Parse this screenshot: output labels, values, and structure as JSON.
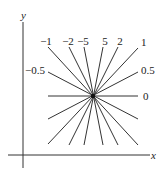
{
  "diagram": {
    "title": "",
    "axes": {
      "x_label": "x",
      "y_label": "y"
    },
    "center": {
      "x": 93,
      "y": 96
    },
    "lines": [
      {
        "slope_label": "0",
        "x1": 48,
        "y1": 96,
        "x2": 138,
        "y2": 96,
        "label_x": 143,
        "label_y": 100,
        "anchor": "start"
      },
      {
        "slope_label": "0.5",
        "x1": 48,
        "y1": 119,
        "x2": 138,
        "y2": 72,
        "label_x": 141,
        "label_y": 74,
        "anchor": "start"
      },
      {
        "slope_label": "1",
        "x1": 48,
        "y1": 144,
        "x2": 138,
        "y2": 48,
        "label_x": 141,
        "label_y": 46,
        "anchor": "start"
      },
      {
        "slope_label": "2",
        "x1": 69,
        "y1": 145,
        "x2": 118,
        "y2": 47,
        "label_x": 120,
        "label_y": 45,
        "anchor": "middle"
      },
      {
        "slope_label": "5",
        "x1": 84,
        "y1": 145,
        "x2": 103,
        "y2": 47,
        "label_x": 105,
        "label_y": 45,
        "anchor": "middle"
      },
      {
        "slope_label": "−5",
        "x1": 103,
        "y1": 145,
        "x2": 84,
        "y2": 47,
        "label_x": 83,
        "label_y": 45,
        "anchor": "middle"
      },
      {
        "slope_label": "−2",
        "x1": 118,
        "y1": 145,
        "x2": 69,
        "y2": 47,
        "label_x": 68,
        "label_y": 45,
        "anchor": "middle"
      },
      {
        "slope_label": "−1",
        "x1": 138,
        "y1": 145,
        "x2": 48,
        "y2": 47,
        "label_x": 46,
        "label_y": 45,
        "anchor": "middle"
      },
      {
        "slope_label": "−0.5",
        "x1": 138,
        "y1": 119,
        "x2": 48,
        "y2": 72,
        "label_x": 45,
        "label_y": 74,
        "anchor": "end"
      }
    ]
  }
}
